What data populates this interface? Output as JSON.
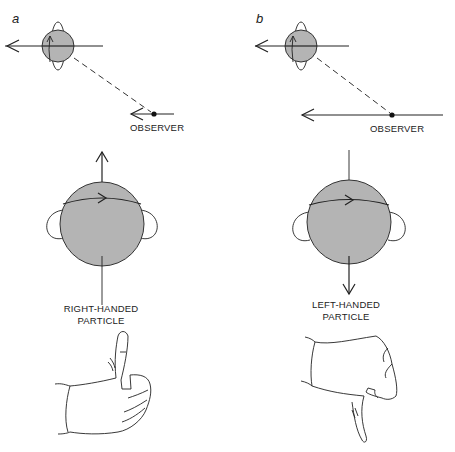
{
  "figure": {
    "panels": [
      {
        "id": "a",
        "letter": "a",
        "observer_label": "OBSERVER",
        "particle_label_line1": "RIGHT-HANDED",
        "particle_label_line2": "PARTICLE",
        "hand_gesture": "thumbs-up",
        "spin_direction": "parallel-to-motion"
      },
      {
        "id": "b",
        "letter": "b",
        "observer_label": "OBSERVER",
        "particle_label_line1": "LEFT-HANDED",
        "particle_label_line2": "PARTICLE",
        "hand_gesture": "thumbs-down",
        "spin_direction": "antiparallel-to-motion"
      }
    ],
    "colors": {
      "sphere_fill": "#b4b4b4",
      "line": "#222222",
      "background": "#ffffff"
    }
  }
}
